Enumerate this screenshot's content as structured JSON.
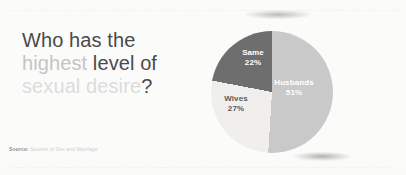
{
  "slide": {
    "background_color": "#fbfbfa"
  },
  "headline": {
    "line1": "Who has the",
    "line2_emphasis": "highest",
    "line2_rest": " level of",
    "line3_faded": "sexual desire",
    "line3_mark": "?",
    "color_dark": "#4a4a4a",
    "color_mid": "#c5c5c5",
    "color_light": "#dcdcdc"
  },
  "source": {
    "label": "Source:",
    "text": " Secrets of Sex and Marriage"
  },
  "ghost": {
    "top_text": "    — –– —– — ––– —— – —––— –— ––—– —– ——–– –— —––— –– ——– –—— ––— —– –—–",
    "bottom_text": "    –—– —— ––— —– —––— ––—– ——– –—–– —–— –– —––— –—— ––—– —– ——–– –—"
  },
  "chart_data": {
    "type": "pie",
    "title": "Who has the highest level of sexual desire?",
    "source": "Secrets of Sex and Marriage",
    "start_angle_deg": 0,
    "direction": "clockwise",
    "legend": "none",
    "labels_inside": true,
    "categories": [
      "Husbands",
      "Wives",
      "Same"
    ],
    "values": [
      51,
      27,
      22
    ],
    "unit": "%",
    "colors": [
      "#c9c9c9",
      "#f0efed",
      "#6e6e6e"
    ],
    "label_colors": [
      "#ffffff",
      "#5a5855",
      "#ffffff"
    ],
    "slices": [
      {
        "name": "Husbands",
        "value": 51,
        "value_label": "51%",
        "color": "#c9c9c9",
        "label_color": "#ffffff",
        "start_deg": 0,
        "end_deg": 183.6
      },
      {
        "name": "Wives",
        "value": 27,
        "value_label": "27%",
        "color": "#f0efed",
        "label_color": "#5a5855",
        "start_deg": 183.6,
        "end_deg": 280.8
      },
      {
        "name": "Same",
        "value": 22,
        "value_label": "22%",
        "color": "#6e6e6e",
        "label_color": "#ffffff",
        "start_deg": 280.8,
        "end_deg": 360
      }
    ]
  }
}
